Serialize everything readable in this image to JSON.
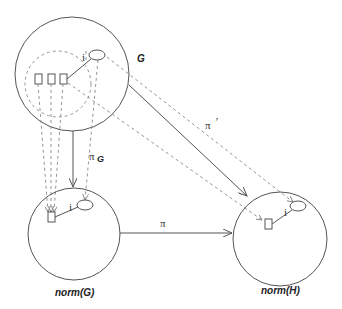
{
  "diagram": {
    "nodes": {
      "G": {
        "label": "G"
      },
      "normG": {
        "label": "norm(G)"
      },
      "normH": {
        "label": "norm(H)"
      }
    },
    "edges": {
      "pi_G": {
        "symbol": "π",
        "subscript": "G"
      },
      "pi": {
        "symbol": "π"
      },
      "pi_prime": {
        "symbol": "π",
        "prime": "’"
      }
    },
    "inner_labels": {
      "i_G": "i",
      "i_normG": "i",
      "i_normH": "i"
    }
  }
}
